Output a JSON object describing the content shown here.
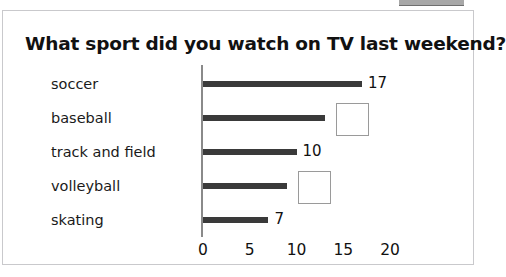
{
  "card": {
    "title": "What sport did you watch on TV last weekend?"
  },
  "chart_data": {
    "type": "bar",
    "orientation": "horizontal",
    "title": "What sport did you watch on TV last weekend?",
    "xlabel": "",
    "ylabel": "",
    "categories": [
      "soccer",
      "baseball",
      "track and field",
      "volleyball",
      "skating"
    ],
    "values": [
      17,
      13,
      10,
      9,
      7
    ],
    "value_labels": [
      "17",
      "",
      "10",
      "",
      "7"
    ],
    "blank_answer_boxes": [
      false,
      true,
      false,
      true,
      false
    ],
    "xlim": [
      0,
      20
    ],
    "xticks": [
      0,
      5,
      10,
      15,
      20
    ],
    "xtick_labels": [
      "0",
      "5",
      "10",
      "15",
      "20"
    ],
    "grid": false,
    "legend": false,
    "bar_color": "#3a3a3a",
    "axis_color": "#8a8a8a",
    "background_color": "#ffffff"
  },
  "styling": {
    "border_color": "#c9c9cc",
    "text_color": "#111111",
    "box_border_color": "#9a9a9a"
  }
}
